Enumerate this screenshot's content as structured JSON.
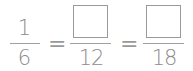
{
  "equation": {
    "fraction1": {
      "numerator": "1",
      "denominator": "6"
    },
    "equals1": "=",
    "fraction2": {
      "numerator": "",
      "denominator": "12"
    },
    "equals2": "=",
    "fraction3": {
      "numerator": "",
      "denominator": "18"
    }
  }
}
